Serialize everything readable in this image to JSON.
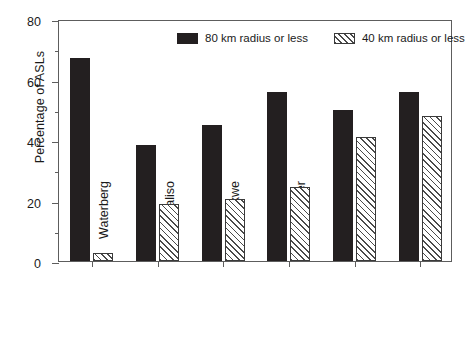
{
  "chart_data": {
    "type": "bar",
    "title": "",
    "subtitle": "",
    "xlabel": "",
    "ylabel": "Percentage of ASLs",
    "ylim": [
      0,
      80
    ],
    "ytick_labels": [
      "0",
      "20",
      "40",
      "60",
      "80"
    ],
    "ytick_values": [
      0,
      20,
      40,
      60,
      80
    ],
    "yminor_values": [
      10,
      30,
      50,
      70
    ],
    "grid": false,
    "legend_position": "top-center-inside",
    "orientation": "vertical",
    "xtick_rotation": 90,
    "categories": [
      "Waterberg",
      "Ismangaliso",
      "Madikwe",
      "S. Kruger",
      "Cape Town",
      "Addo"
    ],
    "series": [
      {
        "name": "80 km radius or less",
        "fill": "solid-black",
        "color": "#231f20",
        "values": [
          67,
          38.5,
          45,
          56,
          50,
          56
        ]
      },
      {
        "name": "40 km radius or less",
        "fill": "diagonal-hatch",
        "color": "#ffffff",
        "values": [
          2.5,
          19,
          20.5,
          24.5,
          41,
          48
        ]
      }
    ]
  },
  "legend": {
    "entries": [
      {
        "label": "80 km radius or less"
      },
      {
        "label": "40 km radius or less"
      }
    ]
  },
  "axes": {
    "y_title": "Percentage of ASLs"
  }
}
